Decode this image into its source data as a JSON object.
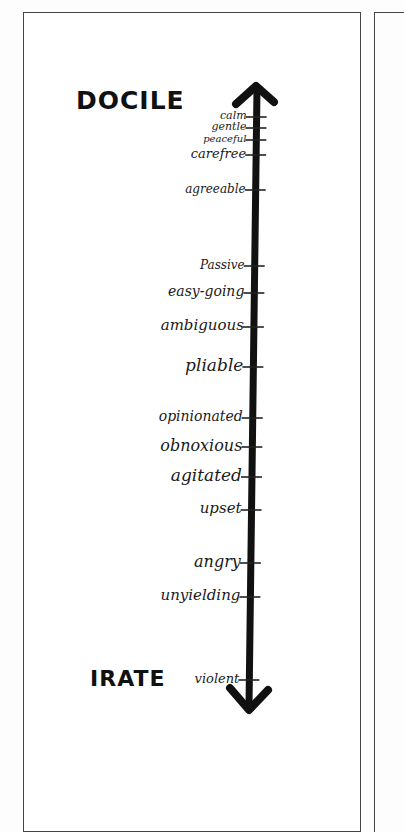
{
  "diagram": {
    "top_label": "DOCILE",
    "bottom_label": "IRATE",
    "arrow": {
      "direction": "bidirectional",
      "color": "#111111"
    },
    "terms": [
      {
        "label": "calm",
        "y": 117
      },
      {
        "label": "gentle",
        "y": 128
      },
      {
        "label": "peaceful",
        "y": 140
      },
      {
        "label": "carefree",
        "y": 155
      },
      {
        "label": "agreeable",
        "y": 190
      },
      {
        "label": "Passive",
        "y": 266
      },
      {
        "label": "easy-going",
        "y": 293
      },
      {
        "label": "ambiguous",
        "y": 327
      },
      {
        "label": "pliable",
        "y": 367
      },
      {
        "label": "opinionated",
        "y": 418
      },
      {
        "label": "obnoxious",
        "y": 447
      },
      {
        "label": "agitated",
        "y": 477
      },
      {
        "label": "upset",
        "y": 510
      },
      {
        "label": "angry",
        "y": 563
      },
      {
        "label": "unyielding",
        "y": 597
      },
      {
        "label": "violent",
        "y": 680
      }
    ]
  }
}
